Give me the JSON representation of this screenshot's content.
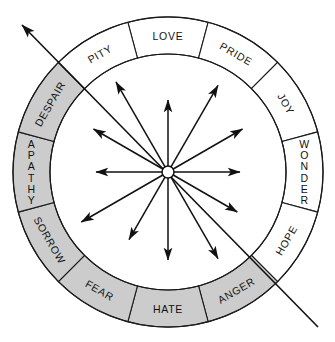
{
  "figure": {
    "name": "emotion-wheel",
    "center": {
      "x": 168,
      "y": 172
    },
    "outer_radius": 155,
    "inner_radius": 118,
    "segment_count": 12,
    "segment_span_degrees": 30,
    "colors": {
      "gray_fill": "#cccccc",
      "white_fill": "#ffffff",
      "stroke": "#1a1a1a",
      "text": "#111111",
      "background": "#ffffff"
    }
  },
  "chart_data": {
    "type": "pie",
    "title": "",
    "xlabel": "",
    "ylabel": "",
    "legend_position": "none",
    "grid": false,
    "categories": [
      "LOVE",
      "PRIDE",
      "JOY",
      "WONDER",
      "HOPE",
      "ANGER",
      "HATE",
      "FEAR",
      "SORROW",
      "APATHY",
      "DESPAIR",
      "PITY"
    ],
    "values": [
      30,
      30,
      30,
      30,
      30,
      30,
      30,
      30,
      30,
      30,
      30,
      30
    ],
    "segments": [
      {
        "label": "LOVE",
        "start_deg": -15,
        "end_deg": 15,
        "fill": "#ffffff",
        "orientation": "tangential",
        "mid_deg": 0
      },
      {
        "label": "PRIDE",
        "start_deg": 15,
        "end_deg": 45,
        "fill": "#ffffff",
        "orientation": "tangential",
        "mid_deg": 30
      },
      {
        "label": "JOY",
        "start_deg": 45,
        "end_deg": 75,
        "fill": "#ffffff",
        "orientation": "tangential",
        "mid_deg": 60
      },
      {
        "label": "WONDER",
        "start_deg": 75,
        "end_deg": 105,
        "fill": "#ffffff",
        "orientation": "stacked",
        "mid_deg": 90
      },
      {
        "label": "HOPE",
        "start_deg": 105,
        "end_deg": 135,
        "fill": "#ffffff",
        "orientation": "tangential",
        "mid_deg": 120
      },
      {
        "label": "ANGER",
        "start_deg": 135,
        "end_deg": 165,
        "fill": "#cccccc",
        "orientation": "tangential",
        "mid_deg": 150
      },
      {
        "label": "HATE",
        "start_deg": 165,
        "end_deg": 195,
        "fill": "#cccccc",
        "orientation": "tangential",
        "mid_deg": 180
      },
      {
        "label": "FEAR",
        "start_deg": 195,
        "end_deg": 225,
        "fill": "#cccccc",
        "orientation": "tangential",
        "mid_deg": 210
      },
      {
        "label": "SORROW",
        "start_deg": 225,
        "end_deg": 255,
        "fill": "#cccccc",
        "orientation": "tangential",
        "mid_deg": 240
      },
      {
        "label": "APATHY",
        "start_deg": 255,
        "end_deg": 285,
        "fill": "#cccccc",
        "orientation": "stacked",
        "mid_deg": 270
      },
      {
        "label": "DESPAIR",
        "start_deg": 285,
        "end_deg": 315,
        "fill": "#cccccc",
        "orientation": "tangential",
        "mid_deg": 300
      },
      {
        "label": "PITY",
        "start_deg": 315,
        "end_deg": 345,
        "fill": "#ffffff",
        "orientation": "tangential",
        "mid_deg": 330
      }
    ],
    "spokes": [
      {
        "angle_deg": 0,
        "length": 72,
        "arrow": true
      },
      {
        "angle_deg": 30,
        "length": 100,
        "arrow": true
      },
      {
        "angle_deg": 60,
        "length": 86,
        "arrow": true
      },
      {
        "angle_deg": 90,
        "length": 72,
        "arrow": true
      },
      {
        "angle_deg": 120,
        "length": 80,
        "arrow": true
      },
      {
        "angle_deg": 150,
        "length": 100,
        "arrow": true
      },
      {
        "angle_deg": 180,
        "length": 88,
        "arrow": true
      },
      {
        "angle_deg": 210,
        "length": 78,
        "arrow": true
      },
      {
        "angle_deg": 240,
        "length": 100,
        "arrow": true
      },
      {
        "angle_deg": 270,
        "length": 72,
        "arrow": true
      },
      {
        "angle_deg": 300,
        "length": 86,
        "arrow": true
      },
      {
        "angle_deg": 330,
        "length": 104,
        "arrow": true
      }
    ],
    "axis": {
      "from": {
        "x": 318,
        "y": 327
      },
      "to": {
        "x": 22,
        "y": 25
      },
      "arrow_at": "to",
      "label": ""
    },
    "hub": {
      "radius": 6
    }
  }
}
